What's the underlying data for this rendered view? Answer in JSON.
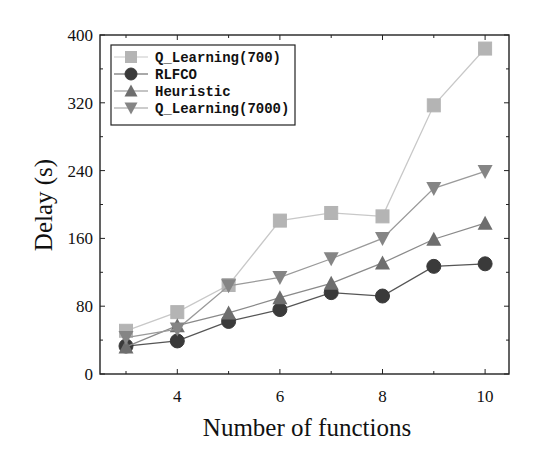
{
  "chart_data": {
    "type": "line",
    "title": "",
    "xlabel": "Number of functions",
    "ylabel": "Delay (s)",
    "x": [
      3,
      4,
      5,
      6,
      7,
      8,
      9,
      10
    ],
    "xticks": [
      4,
      6,
      8,
      10
    ],
    "xlim": [
      2.5,
      10.5
    ],
    "yticks": [
      0,
      80,
      160,
      240,
      320,
      400
    ],
    "ylim": [
      0,
      400
    ],
    "grid": false,
    "legend_position": "upper left",
    "series": [
      {
        "name": "Q_Learning(700)",
        "marker": "square",
        "color": "#b4b4b4",
        "line_color": "#c8c8c8",
        "values": [
          51,
          73,
          105,
          181,
          190,
          186,
          317,
          384
        ]
      },
      {
        "name": "RLFCO",
        "marker": "circle",
        "color": "#3a3a3a",
        "line_color": "#555555",
        "values": [
          33,
          39,
          62,
          76,
          96,
          92,
          127,
          130
        ]
      },
      {
        "name": "Heuristic",
        "marker": "triangle-up",
        "color": "#6e6e6e",
        "line_color": "#8a8a8a",
        "values": [
          32,
          57,
          72,
          90,
          107,
          131,
          159,
          178
        ]
      },
      {
        "name": "Q_Learning(7000)",
        "marker": "triangle-down",
        "color": "#858585",
        "line_color": "#9a9a9a",
        "values": [
          43,
          53,
          104,
          114,
          136,
          160,
          219,
          239
        ]
      }
    ]
  }
}
